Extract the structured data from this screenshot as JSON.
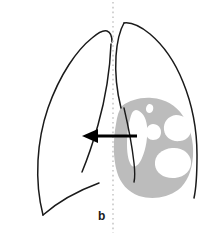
{
  "figure": {
    "panel_label": "b",
    "colors": {
      "background": "#ffffff",
      "outline": "#1a1a1a",
      "consolidation_fill": "#bcbcbc",
      "cavity_fill": "#ffffff",
      "arrow": "#000000",
      "midline": "#cccccc",
      "label": "#1a1a1a"
    }
  },
  "left_lung": {
    "name": "Left lung field",
    "state": "normal",
    "outline_path": "M 43 215 C 34 180 37 140 48 108 C 60 74 77 50 92 38 C 99 32 104 30 107 31 C 110 32 112 36 112 42",
    "medial_path": "M 111 44 C 110 70 105 100 98 125 C 92 146 87 160 82 172",
    "diaphragm_path": "M 43 215 C 60 200 80 190 99 183"
  },
  "right_lung": {
    "name": "Right lung field",
    "state": "consolidated with cavitation",
    "outline_path": "M 124 23 C 131 22 140 26 150 34 C 163 45 175 62 183 82 C 192 104 197 130 197 155 C 197 175 196 189 194 198",
    "medial_path": "M 124 23 C 120 30 117 42 116 56 C 115 72 117 92 121 108",
    "fissure_path": "M 124 108 C 128 125 132 145 134 163 C 135 172 135 178 134 182"
  },
  "consolidation": {
    "name": "Area of consolidation",
    "fill": "#bcbcbc",
    "path": "M 122 106 C 130 100 141 97 152 98 C 165 99 176 105 183 116 C 190 127 194 141 193 156 C 192 171 187 183 178 190 C 167 198 152 200 139 196 C 128 192 120 183 117 172 C 113 158 113 140 116 124 C 117 116 119 110 122 106 Z",
    "cavity_count": 5
  },
  "cavities": [
    {
      "name": "cavity-large-medial",
      "shape": "elongated-vertical",
      "path": "M 136 110 C 142 111 146 117 147 126 C 148 137 146 149 142 158 C 139 165 135 168 132 166 C 129 163 127 155 127 145 C 127 132 129 120 132 113 C 133 111 135 110 136 110 Z"
    },
    {
      "name": "cavity-small-central",
      "shape": "round",
      "path": "M 153 124 C 158 124 161 128 161 132 C 161 137 158 140 153 140 C 149 140 146 137 146 132 C 146 128 149 124 153 124 Z"
    },
    {
      "name": "cavity-upper-lateral",
      "shape": "oval",
      "path": "M 176 115 C 184 115 190 120 191 127 C 192 134 188 140 180 141 C 171 142 165 137 164 130 C 163 122 168 116 176 115 Z"
    },
    {
      "name": "cavity-lower-lateral",
      "shape": "oval-large",
      "path": "M 172 148 C 182 147 190 153 191 161 C 192 170 185 177 175 178 C 164 179 156 173 155 165 C 154 155 162 149 172 148 Z"
    },
    {
      "name": "cavity-notch-superior",
      "shape": "small-notch",
      "path": "M 149 104 C 152 104 154 106 153 110 C 152 113 149 114 147 112 C 145 110 146 105 149 104 Z"
    }
  ],
  "midline": {
    "name": "Midline (dotted)",
    "x": 113,
    "y_start": 2,
    "y_end": 233,
    "style": "dotted"
  },
  "arrow": {
    "name": "Mediastinal shift arrow",
    "direction": "left",
    "tail_x": 137,
    "tip_x": 82,
    "y": 136,
    "shaft_width": 3,
    "head_length": 14,
    "head_width": 15
  }
}
